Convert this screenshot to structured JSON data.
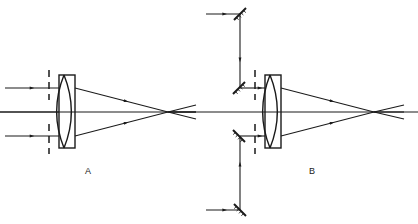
{
  "figure": {
    "background_color": "#ffffff",
    "line_color": "#1a1a1a",
    "width": 418,
    "height": 224
  },
  "panels": [
    {
      "id": "A",
      "label": "A",
      "label_x": 88,
      "label_y": 174,
      "description": "Straight-through configuration: three parallel input rays pass an aperture stop and a biconvex lens in a barrel, converging to a focus.",
      "optical_axis": {
        "y": 112,
        "x_start": 0,
        "x_end": 196
      },
      "aperture_stop": {
        "name": "aperture-stop",
        "x": 49,
        "y_top": 70,
        "y_bottom": 154,
        "style": "dashed",
        "gap_top": 100,
        "gap_bottom": 124
      },
      "lens": {
        "name": "biconvex-lens",
        "center_x": 64,
        "top_y": 75,
        "bottom_y": 148,
        "half_thickness": 7
      },
      "barrel": {
        "name": "lens-barrel",
        "x": 59,
        "y": 75,
        "width": 16,
        "height": 73
      },
      "input_rays": [
        {
          "y": 88,
          "x_start": 5,
          "x_end": 59,
          "arrow_x": 32
        },
        {
          "y": 112,
          "x_start": 0,
          "x_end": 59,
          "arrow_x": 0
        },
        {
          "y": 136,
          "x_start": 5,
          "x_end": 59,
          "arrow_x": 32
        }
      ],
      "output_rays": [
        {
          "x1": 75,
          "y1": 88,
          "x2": 168,
          "y2": 112,
          "arrow_t": 0.55
        },
        {
          "x1": 75,
          "y1": 136,
          "x2": 168,
          "y2": 112,
          "arrow_t": 0.55
        }
      ],
      "focus": {
        "x": 168,
        "y": 112
      },
      "diverging_rays": [
        {
          "x1": 168,
          "y1": 112,
          "x2": 196,
          "y2": 105
        },
        {
          "x1": 168,
          "y1": 112,
          "x2": 196,
          "y2": 119
        },
        {
          "x1": 168,
          "y1": 112,
          "x2": 196,
          "y2": 112
        }
      ]
    },
    {
      "id": "B",
      "label": "B",
      "label_x": 312,
      "label_y": 174,
      "description": "Folded configuration: the two off-axis rays are routed by four 45-degree fold mirrors before entering the same lens assembly.",
      "optical_axis": {
        "y": 112,
        "x_start": 170,
        "x_end": 418
      },
      "aperture_stop": {
        "name": "aperture-stop",
        "x": 255,
        "y_top": 70,
        "y_bottom": 154,
        "style": "dashed",
        "gap_top": 100,
        "gap_bottom": 124
      },
      "lens": {
        "name": "biconvex-lens",
        "center_x": 270,
        "top_y": 75,
        "bottom_y": 148,
        "half_thickness": 7
      },
      "barrel": {
        "name": "lens-barrel",
        "x": 265,
        "y": 75,
        "width": 16,
        "height": 73
      },
      "mirrors": [
        {
          "name": "fold-mirror-top-right",
          "cx": 240,
          "cy": 14,
          "angle": 45,
          "length": 17
        },
        {
          "name": "fold-mirror-top-left",
          "cx": 239,
          "cy": 88,
          "angle": 45,
          "length": 17
        },
        {
          "name": "fold-mirror-bottom-left",
          "cx": 239,
          "cy": 136,
          "angle": -45,
          "length": 17
        },
        {
          "name": "fold-mirror-bottom-right",
          "cx": 240,
          "cy": 210,
          "angle": -45,
          "length": 17
        }
      ],
      "folded_ray_segments": [
        {
          "name": "input-top-horizontal",
          "x1": 206,
          "y1": 14,
          "x2": 240,
          "y2": 14,
          "arrow_t": 0.55
        },
        {
          "name": "top-vertical-down",
          "x1": 240,
          "y1": 14,
          "x2": 240,
          "y2": 88,
          "arrow_t": 0.62
        },
        {
          "name": "top-to-lens-horizontal",
          "x1": 240,
          "y1": 88,
          "x2": 265,
          "y2": 88,
          "arrow_t": 0.8
        },
        {
          "name": "input-bottom-horizontal",
          "x1": 206,
          "y1": 210,
          "x2": 240,
          "y2": 210,
          "arrow_t": 0.55
        },
        {
          "name": "bottom-vertical-up",
          "x1": 240,
          "y1": 210,
          "x2": 240,
          "y2": 136,
          "arrow_t": 0.62
        },
        {
          "name": "bottom-to-lens-horizontal",
          "x1": 240,
          "y1": 136,
          "x2": 265,
          "y2": 136,
          "arrow_t": 0.8
        }
      ],
      "output_rays": [
        {
          "x1": 281,
          "y1": 88,
          "x2": 374,
          "y2": 112,
          "arrow_t": 0.55
        },
        {
          "x1": 281,
          "y1": 136,
          "x2": 374,
          "y2": 112,
          "arrow_t": 0.55
        }
      ],
      "focus": {
        "x": 374,
        "y": 112
      },
      "diverging_rays": [
        {
          "x1": 374,
          "y1": 112,
          "x2": 404,
          "y2": 105
        },
        {
          "x1": 374,
          "y1": 112,
          "x2": 404,
          "y2": 119
        },
        {
          "x1": 374,
          "y1": 112,
          "x2": 404,
          "y2": 112
        }
      ]
    }
  ]
}
